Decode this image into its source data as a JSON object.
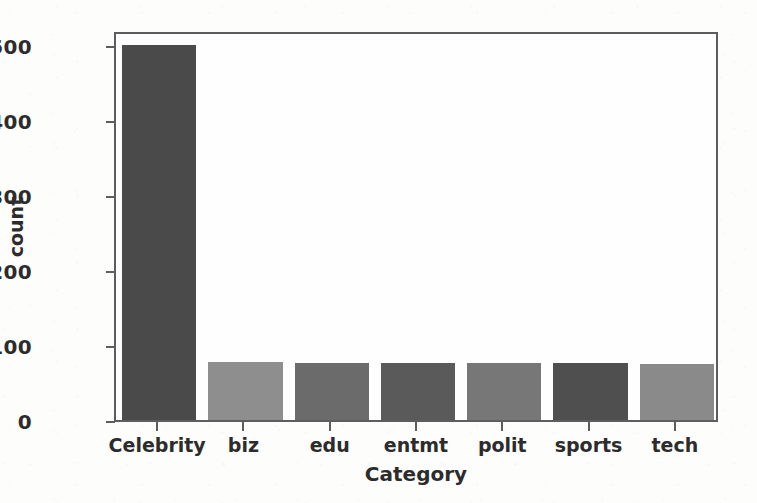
{
  "chart_data": {
    "type": "bar",
    "title": "",
    "xlabel": "Category",
    "ylabel": "count",
    "categories": [
      "Celebrity",
      "biz",
      "edu",
      "entmt",
      "polit",
      "sports",
      "tech"
    ],
    "values": [
      500,
      78,
      76,
      76,
      76,
      76,
      75
    ],
    "series": [
      {
        "name": "count",
        "values": [
          500,
          78,
          76,
          76,
          76,
          76,
          75
        ]
      }
    ],
    "bar_colors": [
      "#4a4a4a",
      "#8e8e8e",
      "#6b6b6b",
      "#5a5a5a",
      "#777777",
      "#4f4f4f",
      "#8a8a8a"
    ],
    "ylim": [
      0,
      520
    ],
    "yticks": [
      0,
      100,
      200,
      300,
      400,
      500
    ],
    "ytick_labels": [
      "0",
      "100",
      "200",
      "300",
      "400",
      "500"
    ],
    "xtick_labels": [
      "Celebrity",
      "biz",
      "edu",
      "entmt",
      "polit",
      "sports",
      "tech"
    ],
    "grid": false,
    "legend": "none",
    "axis_color": "#5d5d5d",
    "text_color": "#2c2c2c",
    "background_color": "#fdfdfc",
    "plot_background_color": "#fefefe"
  }
}
